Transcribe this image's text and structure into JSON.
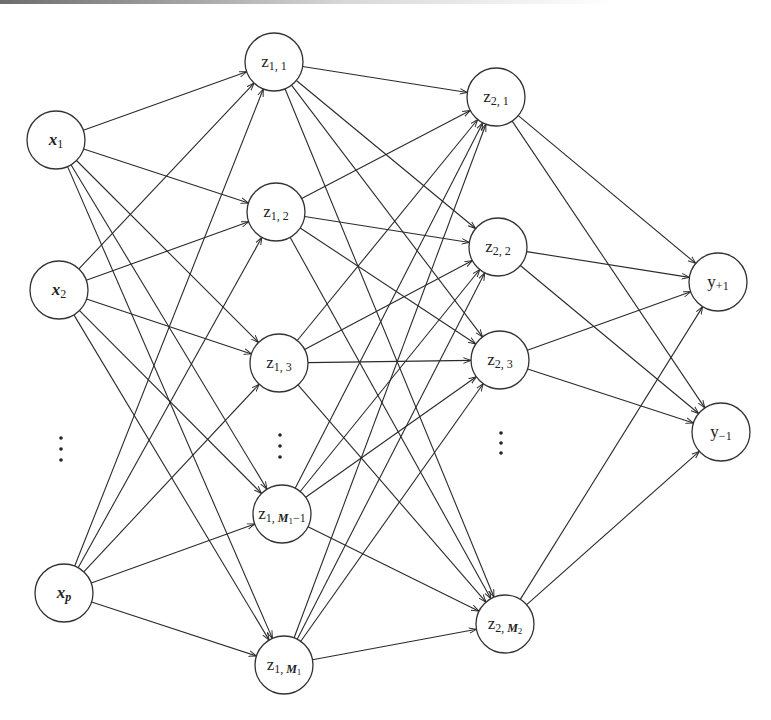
{
  "diagram": {
    "title": "",
    "type": "feedforward-neural-network",
    "colors": {
      "background": "#ffffff",
      "stroke": "#2a2a2a",
      "node_fill": "#ffffff"
    },
    "node_radius": 29,
    "layers": [
      {
        "name": "input",
        "nodes": [
          {
            "id": "x1",
            "main": "x",
            "sub": "1",
            "main_italic": true,
            "x": 56,
            "y": 140
          },
          {
            "id": "x2",
            "main": "x",
            "sub": "2",
            "main_italic": true,
            "x": 59,
            "y": 290
          },
          {
            "id": "xp",
            "main": "x",
            "sub": "p",
            "main_italic": true,
            "sub_italic": true,
            "x": 64,
            "y": 593
          }
        ],
        "ellipsis": {
          "x": 61,
          "y": [
            438,
            449,
            460
          ]
        }
      },
      {
        "name": "hidden-1",
        "nodes": [
          {
            "id": "z1_1",
            "main": "z",
            "sub": "1, 1",
            "x": 274,
            "y": 62
          },
          {
            "id": "z1_2",
            "main": "z",
            "sub": "1, 2",
            "x": 276,
            "y": 212
          },
          {
            "id": "z1_3",
            "main": "z",
            "sub": "1, 3",
            "x": 279,
            "y": 363
          },
          {
            "id": "z1_M1m1",
            "main": "z",
            "sub": "1, ",
            "sub_bold": "M",
            "sub_tail": "1",
            "sub_end": "−1",
            "x": 282,
            "y": 514
          },
          {
            "id": "z1_M1",
            "main": "z",
            "sub": "1, ",
            "sub_bold": "M",
            "sub_tail": "1",
            "sub_end": "",
            "x": 284,
            "y": 665
          }
        ],
        "ellipsis": {
          "x": 280,
          "y": [
            435,
            446,
            457
          ]
        }
      },
      {
        "name": "hidden-2",
        "nodes": [
          {
            "id": "z2_1",
            "main": "z",
            "sub": "2, 1",
            "x": 496,
            "y": 97
          },
          {
            "id": "z2_2",
            "main": "z",
            "sub": "2, 2",
            "x": 498,
            "y": 247
          },
          {
            "id": "z2_3",
            "main": "z",
            "sub": "2, 3",
            "x": 500,
            "y": 360
          },
          {
            "id": "z2_M2",
            "main": "z",
            "sub": "2, ",
            "sub_bold": "M",
            "sub_tail": "2",
            "sub_end": "",
            "x": 505,
            "y": 624
          }
        ],
        "ellipsis": {
          "x": 501,
          "y": [
            433,
            443,
            453
          ]
        }
      },
      {
        "name": "output",
        "nodes": [
          {
            "id": "y_pos",
            "main": "y",
            "sub": "+1",
            "x": 718,
            "y": 282
          },
          {
            "id": "y_neg",
            "main": "y",
            "sub": "−1",
            "x": 721,
            "y": 432
          }
        ]
      }
    ],
    "connectivity": "fully-connected between consecutive layers, arrows point forward"
  }
}
